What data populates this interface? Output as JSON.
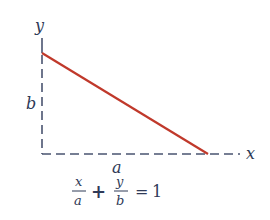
{
  "diagram": {
    "axes": {
      "x_label": "x",
      "y_label": "y"
    },
    "intercepts": {
      "x_intercept_label": "a",
      "y_intercept_label": "b"
    },
    "equation": {
      "term1_num": "x",
      "term1_den": "a",
      "plus": "+",
      "term2_num": "y",
      "term2_den": "b",
      "equals": "=",
      "rhs": "1"
    },
    "colors": {
      "line": "#c0392b",
      "axis": "#4a5470",
      "text": "#2f3a57"
    }
  }
}
